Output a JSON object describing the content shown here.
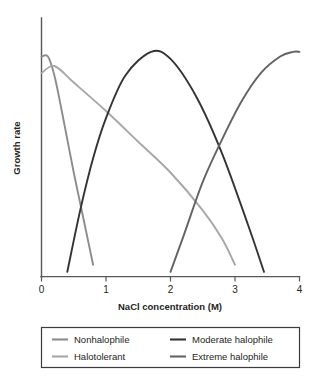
{
  "chart_data": {
    "type": "line",
    "title": "",
    "xlabel": "NaCl concentration (M)",
    "ylabel": "Growth rate",
    "xlim": [
      0,
      4
    ],
    "ylim": [
      0,
      1
    ],
    "grid": false,
    "xticks": [
      "0",
      "1",
      "2",
      "3",
      "4"
    ],
    "xtick_values": [
      0,
      1,
      2,
      3,
      4
    ],
    "yticks": [],
    "legend_position": "below-plot",
    "series": [
      {
        "name": "Nonhalophile",
        "color": "#8c8c8e",
        "peak_x": 0.0,
        "x": [
          0.0,
          0.1,
          0.2,
          0.3,
          0.4,
          0.5,
          0.6,
          0.7,
          0.8
        ],
        "values": [
          0.93,
          0.93,
          0.85,
          0.72,
          0.58,
          0.44,
          0.31,
          0.18,
          0.05
        ]
      },
      {
        "name": "Halotolerant",
        "color": "#a7a7a9",
        "peak_x": 0.2,
        "x": [
          0.0,
          0.2,
          0.5,
          1.0,
          1.5,
          2.0,
          2.5,
          2.8,
          3.0
        ],
        "values": [
          0.86,
          0.89,
          0.82,
          0.7,
          0.57,
          0.44,
          0.28,
          0.16,
          0.05
        ]
      },
      {
        "name": "Moderate halophile",
        "color": "#333335",
        "peak_x": 1.7,
        "x": [
          0.4,
          0.6,
          0.8,
          1.0,
          1.3,
          1.7,
          2.0,
          2.4,
          2.8,
          3.2,
          3.45
        ],
        "values": [
          0.02,
          0.28,
          0.5,
          0.67,
          0.85,
          0.95,
          0.92,
          0.76,
          0.52,
          0.22,
          0.02
        ]
      },
      {
        "name": "Extreme halophile",
        "color": "#636365",
        "peak_x": 3.9,
        "x": [
          2.0,
          2.2,
          2.5,
          2.8,
          3.1,
          3.4,
          3.7,
          3.9,
          4.0
        ],
        "values": [
          0.02,
          0.17,
          0.4,
          0.58,
          0.74,
          0.86,
          0.93,
          0.95,
          0.95
        ]
      }
    ],
    "legend_entries": [
      {
        "label": "Nonhalophile",
        "color": "#8c8c8e"
      },
      {
        "label": "Halotolerant",
        "color": "#a7a7a9"
      },
      {
        "label": "Moderate halophile",
        "color": "#333335"
      },
      {
        "label": "Extreme halophile",
        "color": "#636365"
      }
    ]
  },
  "axes": {
    "x_title": "NaCl concentration (M)",
    "y_title": "Growth rate",
    "tick_0": "0",
    "tick_1": "1",
    "tick_2": "2",
    "tick_3": "3",
    "tick_4": "4"
  },
  "legend": {
    "item_0": "Nonhalophile",
    "item_1": "Halotolerant",
    "item_2": "Moderate halophile",
    "item_3": "Extreme halophile"
  }
}
